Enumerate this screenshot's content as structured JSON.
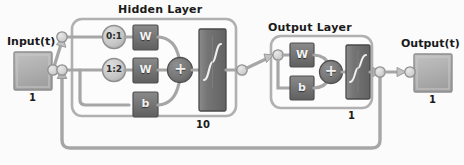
{
  "diagram": {
    "kind": "recurrent-neural-network-architecture",
    "background_color": "#fbfbfb",
    "line_color": "#9a9a9a",
    "block_fill_color": "#6e6e6e",
    "panel_fill_color": "#fcfcfc",
    "io_block_fill_color": "#b3b3b3",
    "delay_fill_color": "#c8c8c8",
    "text_color": "#1a1a1a"
  },
  "input": {
    "label": "Input(t)",
    "size": "1",
    "port_name": "input-port"
  },
  "output": {
    "label": "Output(t)",
    "size": "1",
    "port_name": "output-port"
  },
  "hidden_layer": {
    "title": "Hidden Layer",
    "size": "10",
    "delays": [
      {
        "label": "0:1",
        "name": "input-delay-line"
      },
      {
        "label": "1:2",
        "name": "feedback-delay-line"
      }
    ],
    "weights": [
      {
        "label": "W",
        "name": "hidden-weight-input"
      },
      {
        "label": "W",
        "name": "hidden-weight-feedback"
      }
    ],
    "bias": {
      "label": "b",
      "name": "hidden-bias"
    },
    "sum": {
      "label": "+",
      "name": "hidden-summation"
    },
    "transfer_function": {
      "label": "",
      "name": "hidden-transfer-function",
      "shape": "sigmoid"
    }
  },
  "output_layer": {
    "title": "Output Layer",
    "size": "1",
    "weight": {
      "label": "W",
      "name": "output-weight"
    },
    "bias": {
      "label": "b",
      "name": "output-bias"
    },
    "sum": {
      "label": "+",
      "name": "output-summation"
    },
    "transfer_function": {
      "label": "",
      "name": "output-transfer-function",
      "shape": "sigmoid"
    }
  },
  "connections": {
    "feedback_label": "",
    "feedback_name": "feedback-loop"
  }
}
